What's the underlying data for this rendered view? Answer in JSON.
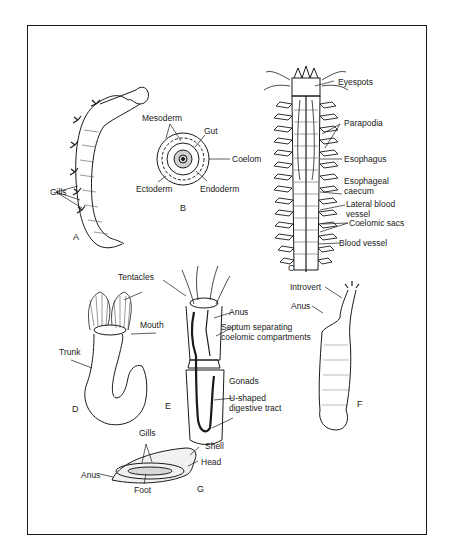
{
  "figure": {
    "panels": [
      {
        "id": "A",
        "label": "A",
        "annotations": [
          "Gills"
        ]
      },
      {
        "id": "B",
        "label": "B",
        "annotations": [
          "Mesoderm",
          "Gut",
          "Coelom",
          "Ectoderm",
          "Endoderm"
        ]
      },
      {
        "id": "C",
        "label": "C",
        "annotations": [
          "Eyespots",
          "Parapodia",
          "Esophagus",
          "Esophageal caecum",
          "Lateral blood vessel",
          "Coelomic sacs",
          "Blood vessel"
        ]
      },
      {
        "id": "D",
        "label": "D",
        "annotations": [
          "Tentacles",
          "Mouth",
          "Trunk"
        ]
      },
      {
        "id": "E",
        "label": "E",
        "annotations": [
          "Anus",
          "Septum separating coelomic compartments",
          "Gonads",
          "U-shaped digestive tract"
        ]
      },
      {
        "id": "F",
        "label": "F",
        "annotations": [
          "Introvert",
          "Anus"
        ]
      },
      {
        "id": "G",
        "label": "G",
        "annotations": [
          "Gills",
          "Shell",
          "Head",
          "Anus",
          "Foot"
        ]
      }
    ]
  },
  "labels": {
    "a_gills": "Gills",
    "a_panel": "A",
    "b_mesoderm": "Mesoderm",
    "b_gut": "Gut",
    "b_coelom": "Coelom",
    "b_ectoderm": "Ectoderm",
    "b_endoderm": "Endoderm",
    "b_panel": "B",
    "c_eyespots": "Eyespots",
    "c_parapodia": "Parapodia",
    "c_esophagus": "Esophagus",
    "c_esophageal_1": "Esophageal",
    "c_esophageal_2": "caecum",
    "c_lateral_1": "Lateral blood",
    "c_lateral_2": "vessel",
    "c_coelomic_sacs": "Coelomic sacs",
    "c_blood_vessel": "Blood vessel",
    "c_panel": "C",
    "d_tentacles": "Tentacles",
    "d_mouth": "Mouth",
    "d_trunk": "Trunk",
    "d_panel": "D",
    "e_anus": "Anus",
    "e_septum_1": "Septum separating",
    "e_septum_2": "coelomic compartments",
    "e_gonads": "Gonads",
    "e_ushaped_1": "U-shaped",
    "e_ushaped_2": "digestive tract",
    "e_panel": "E",
    "f_introvert": "Introvert",
    "f_anus": "Anus",
    "f_panel": "F",
    "g_gills": "Gills",
    "g_shell": "Shell",
    "g_head": "Head",
    "g_anus": "Anus",
    "g_foot": "Foot",
    "g_panel": "G"
  },
  "colors": {
    "ink": "#1a1a1a",
    "background": "#ffffff",
    "shade": "#bdbdbd"
  }
}
